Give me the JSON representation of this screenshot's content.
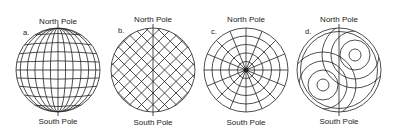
{
  "panels": [
    {
      "id": "a",
      "tag": "a.",
      "north": "North Pole",
      "south": "South Pole",
      "style": "latitude-longitude grid"
    },
    {
      "id": "b",
      "tag": "b.",
      "north": "North Pole",
      "south": "South Pole",
      "style": "diagonal crosshatch grid"
    },
    {
      "id": "c",
      "tag": "c.",
      "north": "North Pole",
      "south": "South Pole",
      "style": "polar radial grid"
    },
    {
      "id": "d",
      "tag": "d.",
      "north": "North Pole",
      "south": "South Pole",
      "style": "two-pole concentric rings"
    }
  ],
  "colors": {
    "stroke": "#222222",
    "background": "#ffffff"
  }
}
